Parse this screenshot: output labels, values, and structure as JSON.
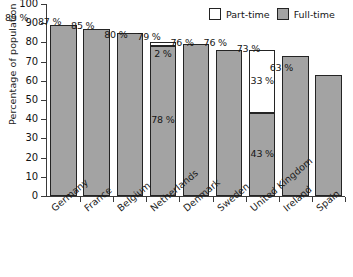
{
  "chart_data": {
    "type": "bar",
    "title": "",
    "subtitle": "",
    "xlabel": "",
    "ylabel": "Percentage of population of 16 – 18-year-olds",
    "ylim": [
      0,
      100
    ],
    "ytick_step": 10,
    "yticks": [
      "100",
      "90",
      "80",
      "70",
      "60",
      "50",
      "40",
      "30",
      "20",
      "10",
      "0"
    ],
    "grid": false,
    "stacked": true,
    "legend_position": "top-right",
    "legend": [
      "Part-time",
      "Full-time"
    ],
    "categories": [
      "Germany",
      "France",
      "Belgium",
      "Netherlands",
      "Denmark",
      "Sweden",
      "United Kingdom",
      "Ireland",
      "Spain"
    ],
    "series": [
      {
        "name": "Full-time",
        "color": "#a3a3a3",
        "values": [
          89,
          87,
          85,
          78,
          79,
          76,
          43,
          73,
          63
        ]
      },
      {
        "name": "Part-time",
        "color": "#ffffff",
        "values": [
          0,
          0,
          0,
          2,
          0,
          0,
          33,
          0,
          0
        ]
      }
    ],
    "totals": [
      89,
      87,
      85,
      80,
      79,
      76,
      76,
      73,
      63
    ],
    "total_labels": [
      "89 %",
      "87 %",
      "85 %",
      "80 %",
      "79 %",
      "76 %",
      "76 %",
      "73 %",
      "63 %"
    ],
    "bars": [
      {
        "category": "Germany",
        "total": 89,
        "total_label": "89 %",
        "full": 89,
        "part": 0,
        "full_label": "",
        "part_label": ""
      },
      {
        "category": "France",
        "total": 87,
        "total_label": "87 %",
        "full": 87,
        "part": 0,
        "full_label": "",
        "part_label": ""
      },
      {
        "category": "Belgium",
        "total": 85,
        "total_label": "85 %",
        "full": 85,
        "part": 0,
        "full_label": "",
        "part_label": ""
      },
      {
        "category": "Netherlands",
        "total": 80,
        "total_label": "80 %",
        "full": 78,
        "part": 2,
        "full_label": "78 %",
        "part_label": "2 %"
      },
      {
        "category": "Denmark",
        "total": 79,
        "total_label": "79 %",
        "full": 79,
        "part": 0,
        "full_label": "",
        "part_label": ""
      },
      {
        "category": "Sweden",
        "total": 76,
        "total_label": "76 %",
        "full": 76,
        "part": 0,
        "full_label": "",
        "part_label": ""
      },
      {
        "category": "United Kingdom",
        "total": 76,
        "total_label": "76 %",
        "full": 43,
        "part": 33,
        "full_label": "43 %",
        "part_label": "33 %"
      },
      {
        "category": "Ireland",
        "total": 73,
        "total_label": "73 %",
        "full": 73,
        "part": 0,
        "full_label": "",
        "part_label": ""
      },
      {
        "category": "Spain",
        "total": 63,
        "total_label": "63 %",
        "full": 63,
        "part": 0,
        "full_label": "",
        "part_label": ""
      }
    ]
  },
  "colors": {
    "full_time": "#a3a3a3",
    "part_time": "#ffffff",
    "outline": "#242424",
    "axis": "#3a3a3a",
    "text": "#161616"
  }
}
